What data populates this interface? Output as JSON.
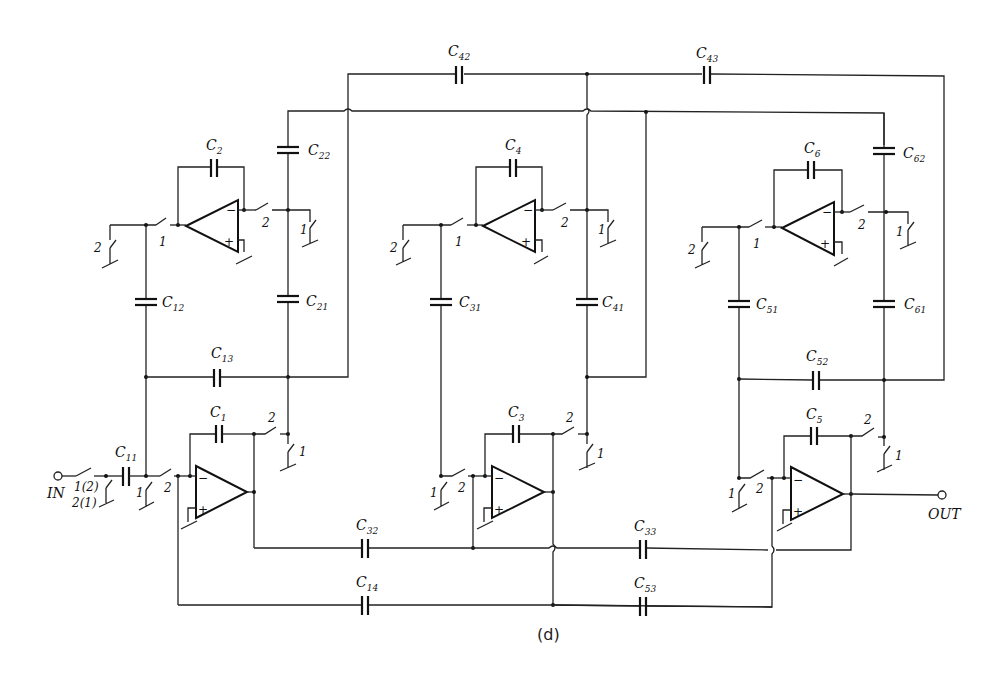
{
  "figure": {
    "caption": "(d)"
  },
  "terminals": {
    "input": "IN",
    "output": "OUT"
  },
  "phase_labels": {
    "p1": "1",
    "p2": "2",
    "in_switch": "1(2)",
    "in_shunt": "2(1)"
  },
  "opamp_signs": {
    "minus": "−",
    "plus": "+"
  },
  "capacitors": {
    "C1": {
      "name": "C",
      "sub": "1"
    },
    "C2": {
      "name": "C",
      "sub": "2"
    },
    "C3": {
      "name": "C",
      "sub": "3"
    },
    "C4": {
      "name": "C",
      "sub": "4"
    },
    "C5": {
      "name": "C",
      "sub": "5"
    },
    "C6": {
      "name": "C",
      "sub": "6"
    },
    "C11": {
      "name": "C",
      "sub": "11"
    },
    "C12": {
      "name": "C",
      "sub": "12"
    },
    "C13": {
      "name": "C",
      "sub": "13"
    },
    "C14": {
      "name": "C",
      "sub": "14"
    },
    "C21": {
      "name": "C",
      "sub": "21"
    },
    "C22": {
      "name": "C",
      "sub": "22"
    },
    "C31": {
      "name": "C",
      "sub": "31"
    },
    "C32": {
      "name": "C",
      "sub": "32"
    },
    "C33": {
      "name": "C",
      "sub": "33"
    },
    "C41": {
      "name": "C",
      "sub": "41"
    },
    "C42": {
      "name": "C",
      "sub": "42"
    },
    "C43": {
      "name": "C",
      "sub": "43"
    },
    "C51": {
      "name": "C",
      "sub": "51"
    },
    "C52": {
      "name": "C",
      "sub": "52"
    },
    "C53": {
      "name": "C",
      "sub": "53"
    },
    "C61": {
      "name": "C",
      "sub": "61"
    },
    "C62": {
      "name": "C",
      "sub": "62"
    }
  }
}
